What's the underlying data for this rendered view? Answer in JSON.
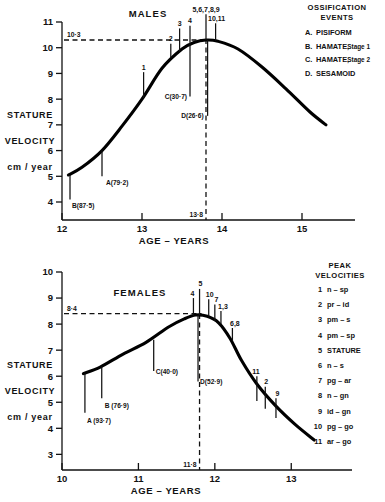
{
  "figure": {
    "panels": [
      "males",
      "females"
    ]
  },
  "males": {
    "title": "MALES",
    "y_axis_label_lines": [
      "STATURE",
      "VELOCITY",
      "cm / year"
    ],
    "x_axis_title": "AGE – YEARS",
    "y_ticks": [
      "4",
      "5",
      "6",
      "7",
      "8",
      "9",
      "10",
      "11"
    ],
    "x_ticks": [
      "12",
      "13",
      "14",
      "15"
    ],
    "peak_reference_value": "10·3",
    "peak_age_label": "13·8",
    "ossification_events": [
      {
        "label": "A(79·2)"
      },
      {
        "label": "B(87·5)"
      },
      {
        "label": "C(30·7)"
      },
      {
        "label": "D(26·6)"
      }
    ],
    "peak_markers": [
      "1",
      "2",
      "3",
      "4",
      "5,6,7,8,9",
      "10,11"
    ],
    "legend": {
      "heading_lines": [
        "OSSIFICATION",
        "EVENTS"
      ],
      "items": [
        {
          "key": "A.",
          "name": "PISIFORM",
          "sub": ""
        },
        {
          "key": "B.",
          "name": "HAMATE,",
          "sub": "Stage 1"
        },
        {
          "key": "C.",
          "name": "HAMATE,",
          "sub": "Stage 2"
        },
        {
          "key": "D.",
          "name": "SESAMOID",
          "sub": ""
        }
      ]
    },
    "chart_data": {
      "type": "line",
      "title": "MALES",
      "xlabel": "AGE – YEARS",
      "ylabel": "STATURE VELOCITY cm / year",
      "xlim": [
        12,
        15.35
      ],
      "ylim": [
        3.3,
        11
      ],
      "grid": false,
      "legend_position": "right",
      "peak": {
        "x": 13.8,
        "y": 10.3
      },
      "reference_line_y": 10.3,
      "series": [
        {
          "name": "Stature velocity (males)",
          "x": [
            12.08,
            12.25,
            12.5,
            12.75,
            13.0,
            13.25,
            13.5,
            13.65,
            13.8,
            13.95,
            14.2,
            14.5,
            14.8,
            15.1,
            15.3
          ],
          "values": [
            5.05,
            5.35,
            6.0,
            6.95,
            8.0,
            9.2,
            9.95,
            10.2,
            10.3,
            10.25,
            9.95,
            9.25,
            8.4,
            7.5,
            7.0
          ]
        }
      ],
      "event_markers": [
        {
          "label": "A(79·2)",
          "x": 12.5,
          "y_top": 6.0,
          "y_bottom": 5.0
        },
        {
          "label": "B(87·5)",
          "x": 12.1,
          "y_top": 5.05,
          "y_bottom": 4.1
        },
        {
          "label": "C(30·7)",
          "x": 13.6,
          "y_top": 10.2,
          "y_bottom": 8.1
        },
        {
          "label": "D(26·6)",
          "x": 13.82,
          "y_top": 10.3,
          "y_bottom": 7.35
        }
      ],
      "peak_velocity_markers": [
        {
          "label": "1",
          "x": 13.02,
          "y_bottom": 8.05,
          "y_top": 9.05
        },
        {
          "label": "2",
          "x": 13.36,
          "y_bottom": 9.6,
          "y_top": 10.15
        },
        {
          "label": "3",
          "x": 13.47,
          "y_bottom": 9.85,
          "y_top": 10.75
        },
        {
          "label": "4",
          "x": 13.6,
          "y_bottom": 10.2,
          "y_top": 10.85
        },
        {
          "label": "5,6,7,8,9",
          "x": 13.8,
          "y_bottom": 10.3,
          "y_top": 11.3
        },
        {
          "label": "10,11",
          "x": 13.92,
          "y_bottom": 10.28,
          "y_top": 10.95
        }
      ]
    }
  },
  "females": {
    "title": "FEMALES",
    "y_axis_label_lines": [
      "STATURE",
      "VELOCITY",
      "cm / year"
    ],
    "x_axis_title": "AGE – YEARS",
    "y_ticks": [
      "3",
      "4",
      "5",
      "6",
      "7",
      "8",
      "9",
      "10"
    ],
    "x_ticks": [
      "10",
      "11",
      "12",
      "13"
    ],
    "peak_reference_value": "8·4",
    "peak_age_label": "11·8",
    "ossification_events": [
      {
        "label": "A (93·7)"
      },
      {
        "label": "B (76·9)"
      },
      {
        "label": "C(40·0)"
      },
      {
        "label": "D(52·9)"
      }
    ],
    "peak_markers": [
      "4",
      "5",
      "10",
      "7",
      "1,3",
      "6,8",
      "11",
      "2",
      "9"
    ],
    "legend": {
      "heading_lines": [
        "PEAK",
        "VELOCITIES"
      ],
      "items": [
        {
          "key": "1",
          "name": "n – sp"
        },
        {
          "key": "2",
          "name": "pr – id"
        },
        {
          "key": "3",
          "name": "pm – s"
        },
        {
          "key": "4",
          "name": "pm – sp"
        },
        {
          "key": "5",
          "name": "STATURE"
        },
        {
          "key": "6",
          "name": "n – s"
        },
        {
          "key": "7",
          "name": "pg – ar"
        },
        {
          "key": "8",
          "name": "n – gn"
        },
        {
          "key": "9",
          "name": "id – gn"
        },
        {
          "key": "10",
          "name": "pg – go"
        },
        {
          "key": "11",
          "name": "ar – go"
        }
      ]
    },
    "chart_data": {
      "type": "line",
      "title": "FEMALES",
      "xlabel": "AGE – YEARS",
      "ylabel": "STATURE VELOCITY cm / year",
      "xlim": [
        10,
        13.35
      ],
      "ylim": [
        2.4,
        10
      ],
      "grid": false,
      "legend_position": "right",
      "peak": {
        "x": 11.8,
        "y": 8.35
      },
      "reference_line_y": 8.4,
      "series": [
        {
          "name": "Stature velocity (females)",
          "x": [
            10.28,
            10.5,
            10.8,
            11.1,
            11.4,
            11.6,
            11.75,
            11.9,
            12.05,
            12.2,
            12.35,
            12.55,
            12.8,
            13.05,
            13.3
          ],
          "values": [
            6.1,
            6.35,
            6.85,
            7.3,
            7.9,
            8.2,
            8.35,
            8.3,
            8.05,
            7.45,
            6.6,
            5.7,
            4.85,
            4.15,
            3.55
          ]
        }
      ],
      "event_markers": [
        {
          "label": "A (93·7)",
          "x": 10.3,
          "y_top": 6.1,
          "y_bottom": 4.6
        },
        {
          "label": "B (76·9)",
          "x": 10.52,
          "y_top": 6.38,
          "y_bottom": 5.15
        },
        {
          "label": "C(40·0)",
          "x": 11.2,
          "y_top": 7.4,
          "y_bottom": 6.2
        },
        {
          "label": "D(52·9)",
          "x": 11.78,
          "y_top": 8.35,
          "y_bottom": 5.8
        }
      ],
      "peak_velocity_markers": [
        {
          "label": "4",
          "x": 11.72,
          "y_bottom": 8.33,
          "y_top": 9.0
        },
        {
          "label": "5",
          "x": 11.8,
          "y_bottom": 8.35,
          "y_top": 9.35
        },
        {
          "label": "10",
          "x": 11.92,
          "y_bottom": 8.3,
          "y_top": 8.95
        },
        {
          "label": "7",
          "x": 12.0,
          "y_bottom": 8.12,
          "y_top": 8.75
        },
        {
          "label": "1,3",
          "x": 12.08,
          "y_bottom": 8.0,
          "y_top": 8.5
        },
        {
          "label": "6,8",
          "x": 12.23,
          "y_bottom": 7.35,
          "y_top": 7.85
        },
        {
          "label": "11",
          "x": 12.55,
          "y_bottom": 5.05,
          "y_top": 6.0
        },
        {
          "label": "2",
          "x": 12.66,
          "y_bottom": 4.75,
          "y_top": 5.6
        },
        {
          "label": "9",
          "x": 12.8,
          "y_bottom": 4.4,
          "y_top": 5.15
        }
      ]
    }
  }
}
